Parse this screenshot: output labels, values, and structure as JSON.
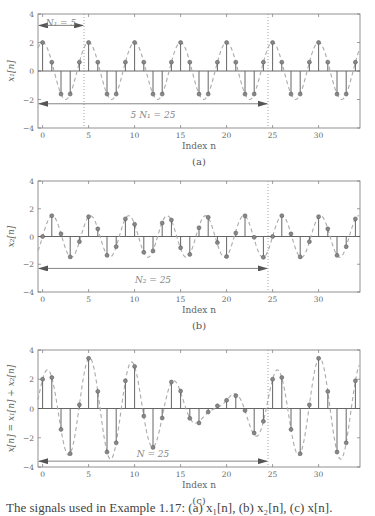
{
  "chart_data": [
    {
      "type": "stem",
      "panel": "(a)",
      "title": "",
      "xlabel": "Index n",
      "ylabel": "x1[n]",
      "xlim": [
        -0.5,
        34.5
      ],
      "ylim": [
        -4,
        4
      ],
      "xticks": [
        0,
        5,
        10,
        15,
        20,
        25,
        30
      ],
      "yticks": [
        -4,
        -2,
        0,
        2,
        4
      ],
      "grid": false,
      "envelope": {
        "style": "dashed",
        "formula": "2cos(2*pi*n/5)"
      },
      "x": [
        0,
        1,
        2,
        3,
        4,
        5,
        6,
        7,
        8,
        9,
        10,
        11,
        12,
        13,
        14,
        15,
        16,
        17,
        18,
        19,
        20,
        21,
        22,
        23,
        24,
        25,
        26,
        27,
        28,
        29,
        30,
        31,
        32,
        33,
        34
      ],
      "values": [
        2.0,
        0.62,
        -1.62,
        -1.62,
        0.62,
        2.0,
        0.62,
        -1.62,
        -1.62,
        0.62,
        2.0,
        0.62,
        -1.62,
        -1.62,
        0.62,
        2.0,
        0.62,
        -1.62,
        -1.62,
        0.62,
        2.0,
        0.62,
        -1.62,
        -1.62,
        0.62,
        2.0,
        0.62,
        -1.62,
        -1.62,
        0.62,
        2.0,
        0.62,
        -1.62,
        -1.62,
        0.62
      ],
      "annotations": [
        {
          "text": "N₁ = 5",
          "arrow_from": -0.5,
          "arrow_to": 4.5,
          "y": 3.2,
          "text_y": 3.4
        },
        {
          "text": "5 N₁ = 25",
          "arrow_from": -0.5,
          "arrow_to": 24.5,
          "y": -2.3,
          "text_y": -3.1
        }
      ],
      "period_markers": [
        4.5,
        24.5
      ]
    },
    {
      "type": "stem",
      "panel": "(b)",
      "title": "",
      "xlabel": "Index n",
      "ylabel": "x2[n]",
      "xlim": [
        -0.5,
        34.5
      ],
      "ylim": [
        -4,
        4
      ],
      "xticks": [
        0,
        5,
        10,
        15,
        20,
        25,
        30
      ],
      "yticks": [
        -4,
        -2,
        0,
        2,
        4
      ],
      "grid": false,
      "envelope": {
        "style": "dashed",
        "formula": "1.5sin(12*pi*n/25)"
      },
      "x": [
        0,
        1,
        2,
        3,
        4,
        5,
        6,
        7,
        8,
        9,
        10,
        11,
        12,
        13,
        14,
        15,
        16,
        17,
        18,
        19,
        20,
        21,
        22,
        23,
        24,
        25,
        26,
        27,
        28,
        29,
        30,
        31,
        32,
        33,
        34
      ],
      "values": [
        0.0,
        1.5,
        0.19,
        -1.47,
        -0.37,
        1.43,
        0.55,
        -1.36,
        -0.73,
        1.27,
        0.88,
        -1.14,
        -1.04,
        0.97,
        1.19,
        -0.81,
        -1.29,
        0.63,
        1.38,
        -0.44,
        -1.44,
        0.25,
        1.49,
        -0.06,
        -1.5,
        0.0,
        1.5,
        0.19,
        -1.47,
        -0.37,
        1.43,
        0.55,
        -1.36,
        -0.73,
        1.27
      ],
      "annotations": [
        {
          "text": "N₂ = 25",
          "arrow_from": -0.5,
          "arrow_to": 24.5,
          "y": -2.3,
          "text_y": -3.1
        }
      ],
      "period_markers": [
        24.5
      ]
    },
    {
      "type": "stem",
      "panel": "(c)",
      "title": "",
      "xlabel": "Index n",
      "ylabel": "x[n] = x1[n] + x2[n]",
      "xlim": [
        -0.5,
        34.5
      ],
      "ylim": [
        -4,
        4
      ],
      "xticks": [
        0,
        5,
        10,
        15,
        20,
        25,
        30
      ],
      "yticks": [
        -4,
        -2,
        0,
        2,
        4
      ],
      "grid": false,
      "envelope": {
        "style": "dashed",
        "formula": "x1 + x2"
      },
      "x": [
        0,
        1,
        2,
        3,
        4,
        5,
        6,
        7,
        8,
        9,
        10,
        11,
        12,
        13,
        14,
        15,
        16,
        17,
        18,
        19,
        20,
        21,
        22,
        23,
        24,
        25,
        26,
        27,
        28,
        29,
        30,
        31,
        32,
        33,
        34
      ],
      "values": [
        2.0,
        2.12,
        -1.43,
        -3.09,
        0.25,
        3.43,
        1.17,
        -2.98,
        -2.35,
        1.89,
        2.88,
        -0.52,
        -2.66,
        -0.65,
        1.81,
        1.19,
        -0.67,
        -0.99,
        -0.24,
        0.18,
        0.56,
        0.87,
        -0.13,
        -1.68,
        -0.88,
        2.0,
        2.12,
        -1.43,
        -3.09,
        0.25,
        3.43,
        1.17,
        -2.98,
        -2.35,
        1.89
      ],
      "annotations": [
        {
          "text": "N = 25",
          "arrow_from": -0.5,
          "arrow_to": 24.5,
          "y": -3.6,
          "text_y": -3.1
        }
      ],
      "period_markers": [
        24.5
      ]
    }
  ],
  "panels": {
    "a": {
      "label": "(a)",
      "xlabel": "Index n",
      "ylabel": "x₁[n]"
    },
    "b": {
      "label": "(b)",
      "xlabel": "Index n",
      "ylabel": "x₂[n]"
    },
    "c": {
      "label": "(c)",
      "xlabel": "Index n",
      "ylabel": "x[n] = x₁[n] + x₂[n]"
    }
  },
  "caption": "The signals used in Example 1.17: (a) x₁[n], (b) x₂[n], (c) x[n].",
  "colors": {
    "stem": "#666666",
    "marker": "#888888",
    "envelope": "#aaaaaa",
    "axis": "#777777",
    "annot": "#888888"
  }
}
